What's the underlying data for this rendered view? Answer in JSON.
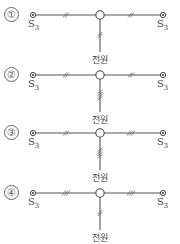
{
  "diagram": {
    "options": [
      {
        "label": "①",
        "left_switch": "S",
        "left_sub": "3",
        "right_switch": "S",
        "right_sub": "3",
        "left_wires": 2,
        "right_wires": 2,
        "source_wires": 2,
        "source_label": "전원"
      },
      {
        "label": "②",
        "left_switch": "S",
        "left_sub": "3",
        "right_switch": "S",
        "right_sub": "3",
        "left_wires": 2,
        "right_wires": 2,
        "source_wires": 4,
        "source_label": "전원"
      },
      {
        "label": "③",
        "left_switch": "S",
        "left_sub": "3",
        "right_switch": "S",
        "right_sub": "3",
        "left_wires": 2,
        "right_wires": 3,
        "source_wires": 4,
        "source_label": "전원"
      },
      {
        "label": "④",
        "left_switch": "S",
        "left_sub": "3",
        "right_switch": "S",
        "right_sub": "3",
        "left_wires": 3,
        "right_wires": 3,
        "source_wires": 2,
        "source_label": "전원"
      }
    ]
  }
}
